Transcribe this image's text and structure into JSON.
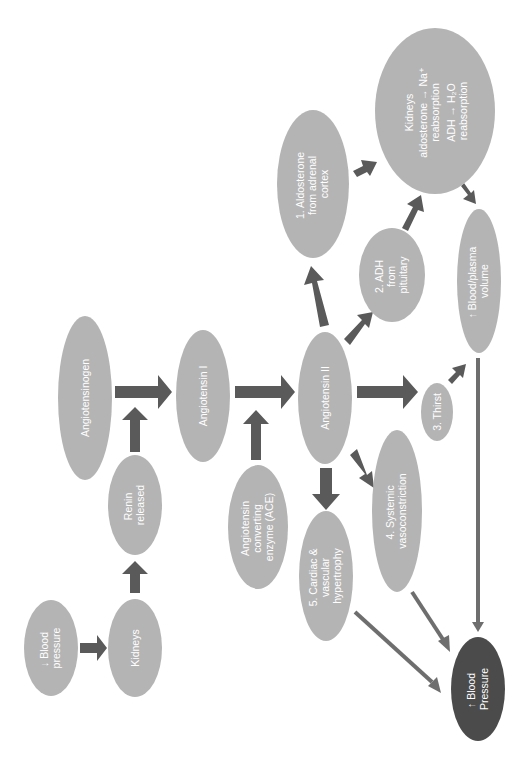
{
  "diagram": {
    "nodes": {
      "bp_low": {
        "lines": [
          "↓ Blood",
          "pressure"
        ]
      },
      "kidneys_start": {
        "lines": [
          "Kidneys"
        ]
      },
      "renin": {
        "lines": [
          "Renin",
          "released"
        ]
      },
      "angiotensinogen": {
        "lines": [
          "Angiotensinogen"
        ]
      },
      "angiotensin1": {
        "lines": [
          "Angiotensin I"
        ]
      },
      "ace": {
        "lines": [
          "Angiotensin",
          "converting",
          "enzyme (ACE)"
        ]
      },
      "angiotensin2": {
        "lines": [
          "Angiotensin II"
        ]
      },
      "aldosterone": {
        "lines": [
          "1. Aldosterone",
          "from adrenal",
          "cortex"
        ]
      },
      "adh": {
        "lines": [
          "2. ADH",
          "from",
          "pituitary"
        ]
      },
      "thirst": {
        "lines": [
          "3. Thirst"
        ]
      },
      "vasoconstriction": {
        "lines": [
          "4. Systemic",
          "vasoconstriction"
        ]
      },
      "hypertrophy": {
        "lines": [
          "5. Cardiac &",
          "vascular",
          "hypertrophy"
        ]
      },
      "kidneys_effect": {
        "title": "Kidneys",
        "lines": [
          "aldosterone → Na⁺",
          "reabsorption",
          "ADH → H₂O",
          "reabsorption"
        ]
      },
      "volume": {
        "lines": [
          "↑ Blood/plasma",
          "volume"
        ]
      },
      "bp_high": {
        "lines": [
          "↑ Blood",
          "Pressure"
        ]
      }
    },
    "edges": [
      {
        "from": "bp_low",
        "to": "kidneys_start",
        "style": "thick"
      },
      {
        "from": "kidneys_start",
        "to": "renin",
        "style": "thick"
      },
      {
        "from": "renin",
        "to": "angiotensinogen-arrow",
        "style": "thick"
      },
      {
        "from": "angiotensinogen",
        "to": "angiotensin1",
        "style": "thick"
      },
      {
        "from": "angiotensin1",
        "to": "angiotensin2",
        "style": "thick"
      },
      {
        "from": "ace",
        "to": "angiotensin1-arrow",
        "style": "thick"
      },
      {
        "from": "angiotensin2",
        "to": "aldosterone",
        "style": "thick"
      },
      {
        "from": "angiotensin2",
        "to": "adh",
        "style": "thick"
      },
      {
        "from": "angiotensin2",
        "to": "thirst",
        "style": "thick"
      },
      {
        "from": "angiotensin2",
        "to": "vasoconstriction",
        "style": "thick"
      },
      {
        "from": "angiotensin2",
        "to": "hypertrophy",
        "style": "thick"
      },
      {
        "from": "aldosterone",
        "to": "kidneys_effect",
        "style": "thick"
      },
      {
        "from": "adh",
        "to": "kidneys_effect",
        "style": "thick"
      },
      {
        "from": "kidneys_effect",
        "to": "volume",
        "style": "thick"
      },
      {
        "from": "thirst",
        "to": "volume",
        "style": "thick"
      },
      {
        "from": "volume",
        "to": "bp_high",
        "style": "thin"
      },
      {
        "from": "vasoconstriction",
        "to": "bp_high",
        "style": "thin"
      },
      {
        "from": "hypertrophy",
        "to": "bp_high",
        "style": "thin"
      }
    ],
    "colors": {
      "node_fill": "#b4b4b4",
      "result_node_fill": "#4b4b4b",
      "arrow_thick": "#5a5a5a",
      "arrow_thin": "#6e6e6e",
      "text": "#ffffff"
    }
  }
}
